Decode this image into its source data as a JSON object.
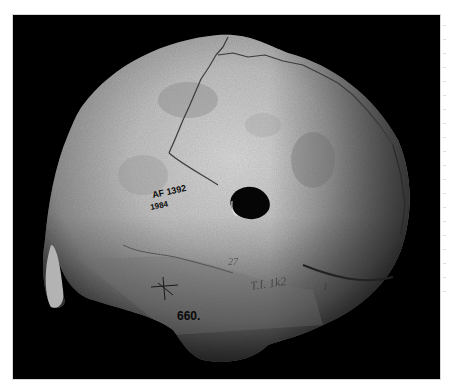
{
  "image": {
    "subject": "Human skull, side/rear view, with perforation (trepanation hole)",
    "background_color": "#000000",
    "bone_color": "#c9c9c9",
    "labels": {
      "catalog_line1": "AF 1392",
      "catalog_line2": "1984",
      "number": "660.",
      "inscription_a": "27",
      "inscription_b": "T.I. 1k2",
      "inscription_c": "1"
    }
  }
}
